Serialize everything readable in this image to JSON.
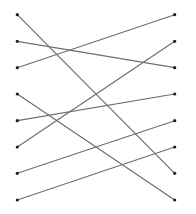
{
  "diagram": {
    "type": "bipartite-matching",
    "width": 196,
    "height": 214,
    "colors": {
      "background": "#ffffff",
      "line": "#6e6e6e",
      "dot": "#1e1e1e"
    },
    "line_width": 1.2,
    "dot_radius": 1.6,
    "left_x": 17.3,
    "right_x": 174.7,
    "rows_y": [
      14.7,
      41.3,
      67.7,
      94.0,
      120.7,
      147.0,
      173.3,
      200.0
    ],
    "left_nodes": [
      {
        "id": "L1",
        "row": 0
      },
      {
        "id": "L2",
        "row": 1
      },
      {
        "id": "L3",
        "row": 2
      },
      {
        "id": "L4",
        "row": 3
      },
      {
        "id": "L5",
        "row": 4
      },
      {
        "id": "L6",
        "row": 5
      },
      {
        "id": "L7",
        "row": 6
      },
      {
        "id": "L8",
        "row": 7
      }
    ],
    "right_nodes": [
      {
        "id": "R1",
        "row": 0
      },
      {
        "id": "R2",
        "row": 1
      },
      {
        "id": "R3",
        "row": 2
      },
      {
        "id": "R4",
        "row": 3
      },
      {
        "id": "R5",
        "row": 4
      },
      {
        "id": "R6",
        "row": 5
      },
      {
        "id": "R7",
        "row": 6
      },
      {
        "id": "R8",
        "row": 7
      }
    ],
    "edges": [
      {
        "from": 0,
        "to": 6
      },
      {
        "from": 1,
        "to": 2
      },
      {
        "from": 2,
        "to": 0
      },
      {
        "from": 3,
        "to": 7
      },
      {
        "from": 4,
        "to": 3
      },
      {
        "from": 5,
        "to": 1
      },
      {
        "from": 6,
        "to": 4
      },
      {
        "from": 7,
        "to": 5
      }
    ]
  }
}
